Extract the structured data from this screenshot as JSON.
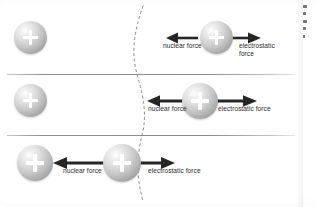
{
  "figure": {
    "label_nuclear": "nuclear force",
    "label_electrostatic": "electrostatic force",
    "label_electrostatic_line1": "electrostatic",
    "label_electrostatic_line2": "force",
    "colors": {
      "arrow": "#262626",
      "divider": "#8a8a8a",
      "boundary_dash": "#8a8a8a",
      "background": "#ffffff",
      "sphere_light": "#ffffff",
      "sphere_dark": "#9a9a9a",
      "label_text": "#2b2b2b"
    },
    "panels": [
      {
        "name": "panel-far",
        "stage": 1,
        "description": "Proton far outside the nucleus boundary: electrostatic repulsion dominates, nuclear force arrow is short.",
        "nuclear_force_label": "nuclear force",
        "electrostatic_force_label": "electrostatic force",
        "nuclear_arrow_length_px": 30,
        "electrostatic_arrow_length_px": 33,
        "nuclear_arrow_direction": "left",
        "electrostatic_arrow_direction": "right"
      },
      {
        "name": "panel-near",
        "stage": 2,
        "description": "Proton closer to the nucleus boundary: both forces comparable, arrows longer.",
        "nuclear_force_label": "nuclear force",
        "electrostatic_force_label": "electrostatic force",
        "nuclear_arrow_length_px": 40,
        "electrostatic_arrow_length_px": 44,
        "nuclear_arrow_direction": "left",
        "electrostatic_arrow_direction": "right"
      },
      {
        "name": "panel-contact",
        "stage": 3,
        "description": "Proton at the nucleus boundary touching the nucleus: nuclear force dominates and pulls it inward.",
        "nuclear_force_label": "nuclear force",
        "electrostatic_force_label": "electrostatic force",
        "nuclear_arrow_length_px": 55,
        "electrostatic_arrow_length_px": 48,
        "nuclear_arrow_direction": "left",
        "electrostatic_arrow_direction": "right"
      }
    ],
    "particles": [
      {
        "name": "nucleus-proton-panel-1",
        "charge": "+",
        "panel": 1,
        "role": "stationary-nucleus"
      },
      {
        "name": "free-proton-panel-1",
        "charge": "+",
        "panel": 1,
        "role": "approaching-proton"
      },
      {
        "name": "nucleus-proton-panel-2",
        "charge": "+",
        "panel": 2,
        "role": "stationary-nucleus"
      },
      {
        "name": "free-proton-panel-2",
        "charge": "+",
        "panel": 2,
        "role": "approaching-proton"
      },
      {
        "name": "nucleus-proton-panel-3",
        "charge": "+",
        "panel": 3,
        "role": "stationary-nucleus"
      },
      {
        "name": "free-proton-panel-3",
        "charge": "+",
        "panel": 3,
        "role": "approaching-proton"
      }
    ]
  }
}
